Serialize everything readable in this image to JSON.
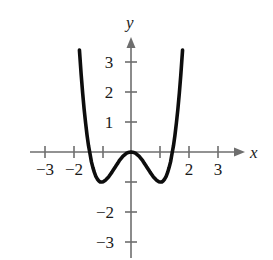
{
  "figure": {
    "background_color": "#ffffff",
    "axis_color": "#6e6e6e",
    "curve_color": "#0d0d0d",
    "text_color": "#1a1a1a",
    "width": 273,
    "height": 260
  },
  "axes": {
    "x_name": "x",
    "y_name": "y",
    "origin_px": {
      "x": 131,
      "y": 152
    },
    "unit_px": {
      "x": 29.3,
      "y": 30
    },
    "x_labels": [
      {
        "value": -3,
        "text": "−3",
        "px_x": 45
      },
      {
        "value": -2,
        "text": "−2",
        "px_x": 74
      },
      {
        "value": 2,
        "text": "2",
        "px_x": 189
      },
      {
        "value": 3,
        "text": "3",
        "px_x": 218
      }
    ],
    "x_ticks": [
      -3,
      -2,
      -1,
      1,
      2,
      3
    ],
    "y_labels": [
      {
        "value": 3,
        "text": "3",
        "px_y": 62
      },
      {
        "value": 2,
        "text": "2",
        "px_y": 92
      },
      {
        "value": 1,
        "text": "1",
        "px_y": 122
      },
      {
        "value": -2,
        "text": "−2",
        "px_y": 212
      },
      {
        "value": -3,
        "text": "−3",
        "px_y": 242
      }
    ],
    "y_ticks": [
      3,
      2,
      1,
      -1,
      -2,
      -3
    ],
    "x_axis_span_px": {
      "from": 30,
      "to": 244
    },
    "y_axis_span_px": {
      "from": 38,
      "to": 258
    }
  },
  "chart_data": {
    "type": "line",
    "title": "",
    "xlabel": "x",
    "ylabel": "y",
    "xlim": [
      -3.6,
      3.8
    ],
    "ylim": [
      -3.6,
      3.6
    ],
    "grid": false,
    "legend": null,
    "equation": "y = x^4 - 2x^2",
    "series": [
      {
        "name": "y = x^4 - 2x^2",
        "color": "#0d0d0d",
        "x": [
          -1.76,
          -1.7,
          -1.65,
          -1.6,
          -1.55,
          -1.5,
          -1.45,
          -1.41,
          -1.35,
          -1.3,
          -1.25,
          -1.2,
          -1.15,
          -1.1,
          -1.05,
          -1.0,
          -0.95,
          -0.9,
          -0.85,
          -0.8,
          -0.75,
          -0.7,
          -0.65,
          -0.6,
          -0.55,
          -0.5,
          -0.45,
          -0.4,
          -0.35,
          -0.3,
          -0.25,
          -0.2,
          -0.15,
          -0.1,
          -0.05,
          0.0,
          0.05,
          0.1,
          0.15,
          0.2,
          0.25,
          0.3,
          0.35,
          0.4,
          0.45,
          0.5,
          0.55,
          0.6,
          0.65,
          0.7,
          0.75,
          0.8,
          0.85,
          0.9,
          0.95,
          1.0,
          1.05,
          1.1,
          1.15,
          1.2,
          1.25,
          1.3,
          1.35,
          1.41,
          1.45,
          1.5,
          1.55,
          1.6,
          1.65,
          1.7,
          1.76
        ],
        "y": [
          3.4,
          2.57,
          1.96,
          1.43,
          0.97,
          0.56,
          0.21,
          0.0,
          -0.33,
          -0.52,
          -0.68,
          -0.81,
          -0.9,
          -0.96,
          -1.0,
          -1.0,
          -0.99,
          -0.96,
          -0.92,
          -0.87,
          -0.81,
          -0.74,
          -0.67,
          -0.59,
          -0.52,
          -0.44,
          -0.37,
          -0.29,
          -0.23,
          -0.17,
          -0.12,
          -0.08,
          -0.04,
          -0.02,
          -0.01,
          0.0,
          -0.01,
          -0.02,
          -0.04,
          -0.08,
          -0.12,
          -0.17,
          -0.23,
          -0.29,
          -0.37,
          -0.44,
          -0.52,
          -0.59,
          -0.67,
          -0.74,
          -0.81,
          -0.87,
          -0.92,
          -0.96,
          -0.99,
          -1.0,
          -1.0,
          -0.96,
          -0.9,
          -0.81,
          -0.68,
          -0.52,
          -0.33,
          0.0,
          0.21,
          0.56,
          0.97,
          1.43,
          1.96,
          2.57,
          3.4
        ]
      }
    ],
    "key_points": {
      "local_maximum": {
        "x": 0,
        "y": 0
      },
      "local_minima": [
        {
          "x": -1,
          "y": -1
        },
        {
          "x": 1,
          "y": -1
        }
      ],
      "x_intercepts": [
        -1.414,
        0,
        1.414
      ]
    }
  }
}
